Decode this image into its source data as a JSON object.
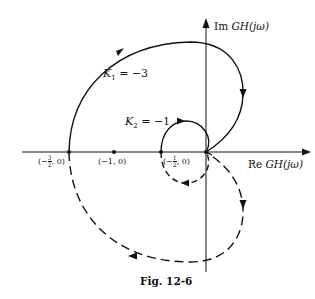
{
  "figure": {
    "caption": "Fig. 12-6",
    "axes": {
      "real_label_prefix": "Re ",
      "real_label_func": "GH(jω)",
      "imag_label_prefix": "Im ",
      "imag_label_func": "GH(jω)"
    },
    "points": [
      {
        "label": "(−3/2, 0)",
        "re": -1.5,
        "im": 0
      },
      {
        "label": "(−1, 0)",
        "re": -1,
        "im": 0
      },
      {
        "label": "(−1/2, 0)",
        "re": -0.5,
        "im": 0
      }
    ],
    "point_labels": {
      "p1": "(−",
      "p1_num": "3",
      "p1_den": "2",
      "p1_tail": ", 0)",
      "p2": "(−1, 0)",
      "p3": "(−",
      "p3_num": "1",
      "p3_den": "2",
      "p3_tail": ", 0)"
    },
    "curves": [
      {
        "name": "K1",
        "label_var": "K",
        "label_sub": "1",
        "label_val": " = −3",
        "crosses_real_axis_at": -1.5,
        "style_upper": "solid",
        "style_lower": "dashed"
      },
      {
        "name": "K2",
        "label_var": "K",
        "label_sub": "2",
        "label_val": " = −1",
        "crosses_real_axis_at": -0.5,
        "style_upper": "solid",
        "style_lower": "dashed"
      }
    ],
    "colors": {
      "ink": "#111111",
      "background": "#ffffff"
    }
  }
}
